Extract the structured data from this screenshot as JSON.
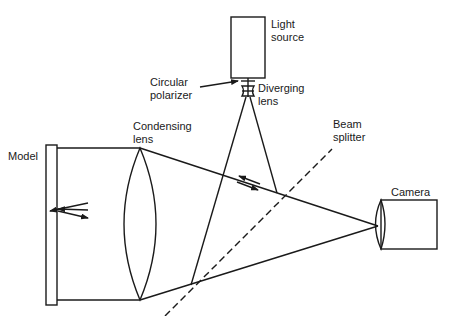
{
  "diagram": {
    "type": "optical-setup",
    "labels": {
      "light_source": [
        "Light",
        "source"
      ],
      "circular_polarizer": [
        "Circular",
        "polarizer"
      ],
      "diverging_lens": [
        "Diverging",
        "lens"
      ],
      "beam_splitter": [
        "Beam",
        "splitter"
      ],
      "condensing_lens": [
        "Condensing",
        "lens"
      ],
      "model": "Model",
      "camera": "Camera"
    },
    "colors": {
      "line": "#1a1a1a",
      "background": "#ffffff"
    }
  }
}
